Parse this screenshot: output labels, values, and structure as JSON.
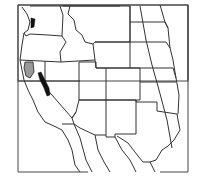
{
  "map": {
    "title": "",
    "region": "Western United States",
    "frame": {
      "x": 18,
      "y": 5,
      "width": 170,
      "height": 76
    },
    "colors": {
      "border": "#333333",
      "range_primary": "#111111",
      "range_secondary": "#999999",
      "background": "#ffffff"
    },
    "layers": [
      {
        "name": "state-borders",
        "type": "lines"
      },
      {
        "name": "distribution-black",
        "areas": [
          "Washington Puget Sound",
          "Sierra Nevada, California"
        ]
      },
      {
        "name": "distribution-gray",
        "areas": [
          "Northwest California"
        ]
      }
    ]
  }
}
